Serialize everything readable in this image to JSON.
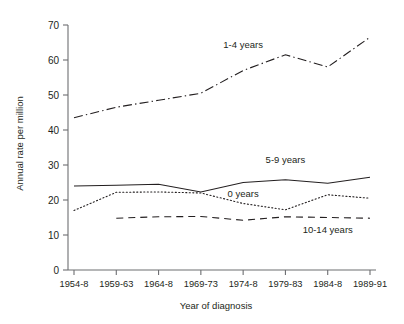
{
  "chart_data": {
    "type": "line",
    "title": "",
    "xlabel": "Year of diagnosis",
    "ylabel": "Annual rate per million",
    "categories": [
      "1954-8",
      "1959-63",
      "1964-8",
      "1969-73",
      "1974-8",
      "1979-83",
      "1984-8",
      "1989-91"
    ],
    "ylim": [
      0,
      70
    ],
    "yticks": [
      0,
      10,
      20,
      30,
      40,
      50,
      60,
      70
    ],
    "grid": false,
    "legend_position": "inline-annotations",
    "series": [
      {
        "name": "1-4 years",
        "style": "dash-dot",
        "color": "#231f20",
        "values": [
          43.5,
          46.5,
          48.5,
          50.5,
          57.0,
          61.5,
          58.0,
          66.5
        ]
      },
      {
        "name": "5-9 years",
        "style": "solid",
        "color": "#231f20",
        "values": [
          24.0,
          24.2,
          24.5,
          22.3,
          25.0,
          25.8,
          24.8,
          26.5
        ]
      },
      {
        "name": "0 years",
        "style": "dotted",
        "color": "#231f20",
        "values": [
          17.0,
          22.2,
          22.3,
          22.0,
          19.0,
          17.2,
          21.5,
          20.5
        ]
      },
      {
        "name": "10-14 years",
        "style": "dashed",
        "color": "#231f20",
        "values": [
          null,
          14.8,
          15.2,
          15.3,
          14.2,
          15.2,
          15.0,
          14.8
        ]
      }
    ],
    "annotations": [
      {
        "text": "1-4 years",
        "x_category": "1974-8",
        "value": 63.5
      },
      {
        "text": "5-9 years",
        "x_category": "1979-83",
        "value": 30.5
      },
      {
        "text": "0 years",
        "x_category": "1974-8",
        "value": 21.0
      },
      {
        "text": "10-14 years",
        "x_category": "1984-8",
        "value": 10.5
      }
    ]
  }
}
